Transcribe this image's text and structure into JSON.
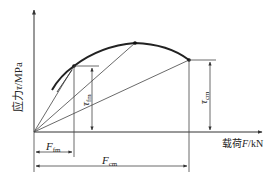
{
  "diagram": {
    "type": "stress-load curve",
    "y_axis": {
      "label_cn": "应力",
      "label_symbol": "τ",
      "label_unit": "/MPa"
    },
    "x_axis": {
      "label_cn": "载荷",
      "label_symbol": "F",
      "label_unit": "/kN"
    },
    "points": [
      {
        "name": "fm",
        "x": 74,
        "y": 66
      },
      {
        "name": "peak",
        "x": 135,
        "y": 43
      },
      {
        "name": "cm",
        "x": 189,
        "y": 60
      }
    ],
    "annotations": {
      "tau_fm": {
        "base": "τ",
        "sub": "fm"
      },
      "tau_cm": {
        "base": "τ",
        "sub": "cm"
      },
      "F_fm": {
        "base": "F",
        "sub": "fm"
      },
      "F_cm": {
        "base": "F",
        "sub": "cm"
      }
    },
    "colors": {
      "line": "#333333",
      "curve": "#222222",
      "background": "#ffffff"
    }
  }
}
